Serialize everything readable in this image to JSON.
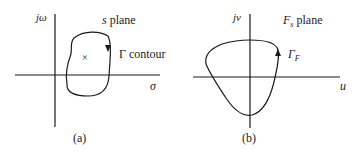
{
  "figure": {
    "panel_a": {
      "caption": "(a)",
      "vertical_axis_label": "jω",
      "horizontal_axis_label": "σ",
      "plane_label_var": "s",
      "plane_label_word": "plane",
      "contour_label_symbol": "Γ",
      "contour_label_word": "contour",
      "marker": "×"
    },
    "panel_b": {
      "caption": "(b)",
      "vertical_axis_label": "jv",
      "horizontal_axis_label": "u",
      "plane_label_var": "F",
      "plane_label_sub": "s",
      "plane_label_word": "plane",
      "contour_label_var": "Γ",
      "contour_label_sub": "F"
    },
    "colors": {
      "line": "#1a1a1a",
      "background": "#ffffff"
    }
  }
}
